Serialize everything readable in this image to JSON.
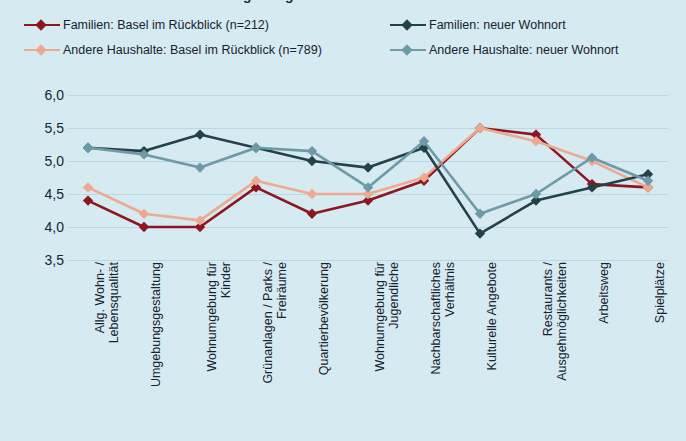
{
  "title_fragment": "Zufriedenheit mit Wohnumgebung",
  "background_color": "#d6eaf2",
  "legend": {
    "items": [
      {
        "label": "Familien: Basel im Rückblick (n=212)",
        "color": "#8e1620",
        "key": "diamond-marker"
      },
      {
        "label": "Andere Haushalte: Basel im Rückblick (n=789)",
        "color": "#eeaa90",
        "key": "diamond-marker"
      },
      {
        "label": "Familien: neuer Wohnort",
        "color": "#234247",
        "key": "diamond-marker"
      },
      {
        "label": "Andere Haushalte: neuer Wohnort",
        "color": "#6d9aa6",
        "key": "diamond-marker"
      }
    ]
  },
  "chart_data": {
    "type": "line",
    "title": "Zufriedenheit mit Wohnumgebung",
    "xlabel": "",
    "ylabel": "",
    "ylim": [
      3.5,
      6.0
    ],
    "ytick_values": [
      6.0,
      5.5,
      5.0,
      4.5,
      4.0,
      3.5
    ],
    "ytick_labels": [
      "6,0",
      "5,5",
      "5,0",
      "4,5",
      "4,0",
      "3,5"
    ],
    "grid": true,
    "legend_position": "top",
    "categories": [
      "Allg. Wohn- / Lebensqualität",
      "Umgebungsgestaltung",
      "Wohnumgebung für Kinder",
      "Grünanlagen / Parks / Freiräume",
      "Quartierbevölkerung",
      "Wohnumgebung für Jugendliche",
      "Nachbarschaftliches Verhältnis",
      "Kulturelle Angebote",
      "Restaurants / Ausgehmöglichkeiten",
      "Arbeitsweg",
      "Spielplätze"
    ],
    "category_lines": [
      [
        "Allg. Wohn- /",
        "Lebensqualität"
      ],
      [
        "Umgebungsgestaltung"
      ],
      [
        "Wohnumgebung für",
        "Kinder"
      ],
      [
        "Grünanlagen / Parks /",
        "Freiräume"
      ],
      [
        "Quartierbevölkerung"
      ],
      [
        "Wohnumgebung für",
        "Jugendliche"
      ],
      [
        "Nachbarschaftliches",
        "Verhältnis"
      ],
      [
        "Kulturelle Angebote"
      ],
      [
        "Restaurants /",
        "Ausgehmöglichkeiten"
      ],
      [
        "Arbeitsweg"
      ],
      [
        "Spielplätze"
      ]
    ],
    "series": [
      {
        "name": "Familien: Basel im Rückblick (n=212)",
        "color": "#8e1620",
        "values": [
          4.4,
          4.0,
          4.0,
          4.6,
          4.2,
          4.4,
          4.7,
          5.5,
          5.4,
          4.65,
          4.6
        ]
      },
      {
        "name": "Andere Haushalte: Basel im Rückblick (n=789)",
        "color": "#eeaa90",
        "values": [
          4.6,
          4.2,
          4.1,
          4.7,
          4.5,
          4.5,
          4.75,
          5.5,
          5.3,
          5.0,
          4.6
        ]
      },
      {
        "name": "Familien: neuer Wohnort",
        "color": "#234247",
        "values": [
          5.2,
          5.15,
          5.4,
          5.2,
          5.0,
          4.9,
          5.2,
          3.9,
          4.4,
          4.6,
          4.8
        ]
      },
      {
        "name": "Andere Haushalte: neuer Wohnort",
        "color": "#6d9aa6",
        "values": [
          5.2,
          5.1,
          4.9,
          5.2,
          5.15,
          4.6,
          5.3,
          4.2,
          4.5,
          5.05,
          4.7
        ]
      }
    ]
  }
}
